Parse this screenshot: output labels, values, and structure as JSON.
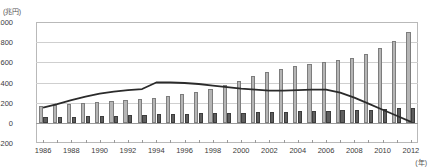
{
  "axes": {
    "y_unit_label": "(兆円)",
    "x_unit_label": "(年)",
    "y_ticks": [
      1000,
      800,
      600,
      400,
      200,
      0,
      -200
    ],
    "x_tick_labels": [
      1986,
      1988,
      1990,
      1992,
      1994,
      1996,
      1998,
      2000,
      2002,
      2004,
      2006,
      2008,
      2010,
      2012
    ]
  },
  "chart_data": {
    "type": "bar",
    "title": "",
    "xlabel": "(年)",
    "ylabel": "(兆円)",
    "ylim": [
      -200,
      1000
    ],
    "grid": true,
    "legend": "none",
    "categories": [
      1986,
      1987,
      1988,
      1989,
      1990,
      1991,
      1992,
      1993,
      1994,
      1995,
      1996,
      1997,
      1998,
      1999,
      2000,
      2001,
      2002,
      2003,
      2004,
      2005,
      2006,
      2007,
      2008,
      2009,
      2010,
      2011,
      2012
    ],
    "series": [
      {
        "name": "light-bar",
        "type": "bar",
        "color": "#b5b5b5",
        "values": [
          170,
          180,
          190,
          200,
          210,
          215,
          225,
          240,
          250,
          270,
          290,
          310,
          340,
          380,
          420,
          460,
          500,
          530,
          560,
          580,
          600,
          620,
          640,
          680,
          740,
          810,
          900
        ]
      },
      {
        "name": "dark-bar",
        "type": "bar",
        "color": "#5e5e5e",
        "values": [
          60,
          55,
          60,
          65,
          70,
          70,
          75,
          80,
          85,
          90,
          90,
          95,
          95,
          100,
          100,
          105,
          110,
          110,
          115,
          120,
          120,
          125,
          125,
          130,
          135,
          145,
          150
        ]
      },
      {
        "name": "line",
        "type": "line",
        "color": "#2b2b2b",
        "values": [
          150,
          185,
          225,
          260,
          290,
          310,
          325,
          335,
          400,
          400,
          395,
          385,
          370,
          355,
          340,
          330,
          320,
          320,
          325,
          330,
          330,
          300,
          250,
          190,
          130,
          70,
          10
        ]
      }
    ]
  }
}
